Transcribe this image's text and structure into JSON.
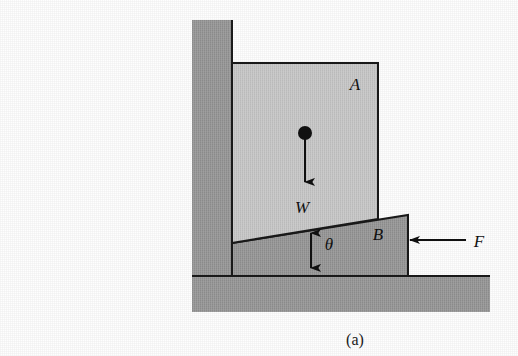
{
  "figure": {
    "caption": "(a)",
    "labels": {
      "block_a": "A",
      "block_b": "B",
      "weight": "W",
      "angle": "θ",
      "force": "F"
    },
    "colors": {
      "background": "#fefefe",
      "wall_fill": "#9a9a9a",
      "floor_fill": "#9a9a9a",
      "block_a_fill": "#c9c9c9",
      "block_b_fill": "#9a9a9a",
      "gap_fill": "#f4f4f4",
      "outline": "#1a1a1a",
      "arrow": "#111111"
    },
    "geometry": {
      "wall": {
        "x": 192,
        "y": 20,
        "width": 40,
        "height": 292
      },
      "floor": {
        "x": 192,
        "y": 276,
        "width": 298,
        "height": 36
      },
      "block_a": {
        "left": 232,
        "top": 63,
        "right": 378,
        "bottom_left_y": 243,
        "bottom_right_y": 219
      },
      "block_b": {
        "apex_x": 232,
        "apex_y": 243,
        "top_right_x": 408,
        "top_right_y": 215,
        "base_y": 276
      },
      "gap": {
        "x": 232,
        "y": 243,
        "width": 46,
        "height": 33
      },
      "weight_arrow": {
        "dot_x": 305,
        "dot_y": 133,
        "tip_x": 305,
        "tip_y": 186
      },
      "force_arrow": {
        "tail_x": 462,
        "tip_x": 404,
        "y": 240
      },
      "angle_arrow": {
        "x": 311,
        "top_y": 227,
        "bottom_y": 274
      }
    },
    "label_positions": {
      "block_a": {
        "x": 355,
        "y": 90
      },
      "block_b": {
        "x": 378,
        "y": 240
      },
      "weight": {
        "x": 302,
        "y": 212
      },
      "angle": {
        "x": 329,
        "y": 249
      },
      "force": {
        "x": 479,
        "y": 246
      },
      "caption": {
        "x": 355,
        "y": 344
      }
    }
  }
}
